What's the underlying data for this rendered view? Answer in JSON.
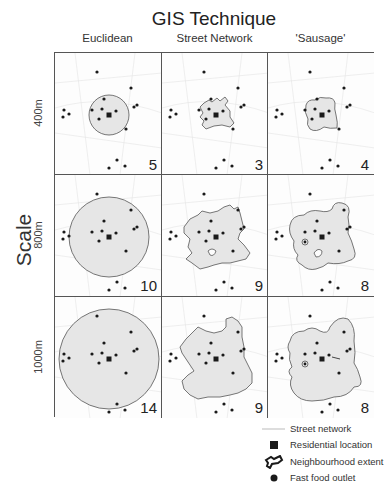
{
  "figure": {
    "title": "GIS Technique",
    "y_axis_title": "Scale",
    "columns": [
      {
        "label": "Euclidean"
      },
      {
        "label": "Street Network"
      },
      {
        "label": "'Sausage'"
      }
    ],
    "rows": [
      {
        "label": "400m",
        "counts": [
          "5",
          "3",
          "4"
        ]
      },
      {
        "label": "800m",
        "counts": [
          "10",
          "9",
          "8"
        ]
      },
      {
        "label": "1000m",
        "counts": [
          "14",
          "9",
          "8"
        ]
      }
    ]
  },
  "legend": {
    "items": [
      {
        "label": "Street network",
        "symbol": "line"
      },
      {
        "label": "Residential location",
        "symbol": "square"
      },
      {
        "label": "Neighbourhood extent",
        "symbol": "polygon-outline"
      },
      {
        "label": "Fast food outlet",
        "symbol": "dot"
      }
    ]
  },
  "colors": {
    "frame": "#555555",
    "extent_fill": "#e6e6e6",
    "extent_stroke": "#555555",
    "points": "#1a1a1a",
    "street": "#dddddd"
  }
}
